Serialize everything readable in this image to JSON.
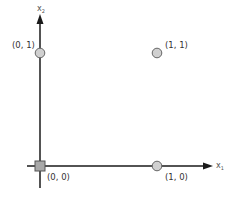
{
  "diagram": {
    "type": "coordinate-plane",
    "axes": {
      "x": {
        "label": "x",
        "subscript": "1"
      },
      "y": {
        "label": "x",
        "subscript": "2"
      }
    },
    "points": [
      {
        "id": "p00",
        "label": "(0, 0)",
        "shape": "square",
        "x": 0,
        "y": 0
      },
      {
        "id": "p10",
        "label": "(1, 0)",
        "shape": "circle",
        "x": 1,
        "y": 0
      },
      {
        "id": "p01",
        "label": "(0, 1)",
        "shape": "circle",
        "x": 0,
        "y": 1
      },
      {
        "id": "p11",
        "label": "(1, 1)",
        "shape": "circle",
        "x": 1,
        "y": 1
      }
    ],
    "colors": {
      "axis": "#1a1a1a",
      "point_fill": "#d0d0d0",
      "point_stroke": "#666666",
      "square_fill": "#a8a8a8",
      "label": "#333333"
    }
  }
}
